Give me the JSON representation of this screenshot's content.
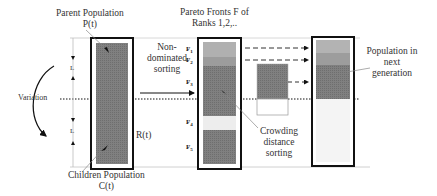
{
  "diagram": {
    "type": "nsga-ii-selection-flow",
    "labels": {
      "parent_population": [
        "Parent Population",
        "P(t)"
      ],
      "children_population": [
        "Children Population",
        "C(t)"
      ],
      "pareto_fronts": [
        "Pareto Fronts F of",
        "Ranks 1,2,.."
      ],
      "non_dominated_sorting": [
        "Non-",
        "dominated",
        "sorting"
      ],
      "crowding_distance_sorting": [
        "Crowding",
        "distance",
        "sorting"
      ],
      "population_next_generation": [
        "Population in",
        "next",
        "generation"
      ],
      "variation": "Variation",
      "combined": "R(t)",
      "size_top": "L",
      "size_bottom": "L"
    },
    "fronts": [
      "F1",
      "F2",
      "F3",
      "F4",
      "F5"
    ],
    "colors": {
      "dark_fill": "#7d7d7d",
      "mid_fill": "#9a9a9a",
      "light_fill": "#b3b3b3",
      "empty_fill": "#f2f2f2",
      "border": "#111111"
    }
  }
}
